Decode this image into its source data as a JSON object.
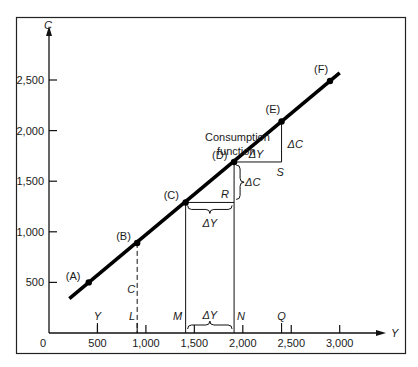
{
  "chart_data": {
    "type": "line",
    "title": "",
    "xlabel": "Y",
    "ylabel": "C",
    "origin_label": "0",
    "xlim": [
      0,
      3750
    ],
    "ylim": [
      0,
      2800
    ],
    "x_ticks": [
      500,
      1000,
      1500,
      2000,
      2500,
      3000
    ],
    "x_tick_labels": [
      "500",
      "1,000",
      "1,500",
      "2,000",
      "2,500",
      "3,000"
    ],
    "y_ticks": [
      500,
      1000,
      1500,
      2000,
      2500
    ],
    "y_tick_labels": [
      "500",
      "1,000",
      "1,500",
      "2,000",
      "2,500"
    ],
    "grid": false,
    "series": [
      {
        "name": "Consumption function",
        "line_from": [
          210,
          340
        ],
        "line_to": [
          3000,
          2570
        ],
        "points": [
          {
            "label": "(A)",
            "x": 410,
            "y": 500
          },
          {
            "label": "(B)",
            "x": 910,
            "y": 890
          },
          {
            "label": "(C)",
            "x": 1410,
            "y": 1290
          },
          {
            "label": "(D)",
            "x": 1910,
            "y": 1690
          },
          {
            "label": "(E)",
            "x": 2400,
            "y": 2090
          },
          {
            "label": "(F)",
            "x": 2900,
            "y": 2490
          }
        ]
      }
    ],
    "annotations": {
      "curve_label": [
        "Consumption",
        "function"
      ],
      "axis_markers": [
        {
          "label": "Y",
          "x": 500
        },
        {
          "label": "L",
          "x": 910
        },
        {
          "label": "M",
          "x": 1410
        },
        {
          "label": "N",
          "x": 1910
        },
        {
          "label": "Q",
          "x": 2400
        }
      ],
      "dashed_label": "C",
      "point_R": "R",
      "point_S": "S",
      "delta_y": "ΔY",
      "delta_c": "ΔC"
    }
  }
}
